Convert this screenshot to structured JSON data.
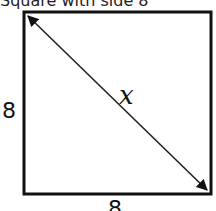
{
  "title": "Square with side 8",
  "diagram": {
    "shape": "square",
    "labels": {
      "left_side": "8",
      "bottom_side": "8",
      "diagonal": "x"
    },
    "colors": {
      "stroke": "#111111",
      "background": "#ffffff"
    }
  }
}
